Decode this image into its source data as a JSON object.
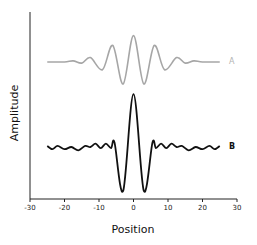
{
  "chart_data": {
    "type": "line",
    "title": "",
    "xlabel": "Position",
    "ylabel": "Amplitude",
    "xlim": [
      -30,
      30
    ],
    "xticks": [
      -30,
      -20,
      -10,
      0,
      10,
      20,
      30
    ],
    "xtick_labels": [
      "-30",
      "-20",
      "-10",
      "0",
      "10",
      "20",
      "30"
    ],
    "yticks": [],
    "grid": false,
    "legend": "inline labels at right end of each curve",
    "series": [
      {
        "name": "A",
        "color": "#a6a6a6",
        "description": "Gaussian-enveloped cosine wave packet centered at 0",
        "x_range": [
          -25,
          25
        ],
        "baseline_px": 62,
        "points": [
          [
            -25,
            0
          ],
          [
            -20,
            0.0
          ],
          [
            -17.5,
            0.05
          ],
          [
            -15,
            -0.05
          ],
          [
            -12.5,
            0.2
          ],
          [
            -9,
            -0.35
          ],
          [
            -6,
            0.75
          ],
          [
            -3,
            -1.0
          ],
          [
            0,
            1.2
          ],
          [
            3,
            -1.0
          ],
          [
            6,
            0.75
          ],
          [
            9,
            -0.35
          ],
          [
            12.5,
            0.2
          ],
          [
            15,
            -0.05
          ],
          [
            17.5,
            0.05
          ],
          [
            20,
            0.0
          ],
          [
            25,
            0
          ]
        ]
      },
      {
        "name": "B",
        "color": "#111111",
        "description": "Central sharp peak with deep side troughs and small ripples",
        "x_range": [
          -25,
          25
        ],
        "baseline_px": 147,
        "points": [
          [
            -25,
            0.05
          ],
          [
            -23.5,
            -0.1
          ],
          [
            -22,
            0.05
          ],
          [
            -20,
            -0.1
          ],
          [
            -18,
            0.0
          ],
          [
            -16,
            -0.15
          ],
          [
            -14,
            0.05
          ],
          [
            -12.5,
            0.0
          ],
          [
            -11,
            0.15
          ],
          [
            -9.5,
            -0.05
          ],
          [
            -8,
            0.15
          ],
          [
            -6.5,
            -0.05
          ],
          [
            -5.5,
            0.2
          ],
          [
            -3,
            -2.0
          ],
          [
            0,
            2.4
          ],
          [
            3,
            -2.0
          ],
          [
            5.5,
            0.2
          ],
          [
            6.5,
            -0.05
          ],
          [
            8,
            0.15
          ],
          [
            9.5,
            -0.05
          ],
          [
            11,
            0.15
          ],
          [
            12.5,
            0.0
          ],
          [
            14,
            0.05
          ],
          [
            16,
            -0.15
          ],
          [
            18,
            0.0
          ],
          [
            20,
            -0.1
          ],
          [
            22,
            0.05
          ],
          [
            23.5,
            -0.1
          ],
          [
            25,
            0.05
          ]
        ]
      }
    ]
  },
  "labels": {
    "series_a": "A",
    "series_b": "B",
    "x_axis_title": "Position",
    "y_axis_title": "Amplitude"
  }
}
